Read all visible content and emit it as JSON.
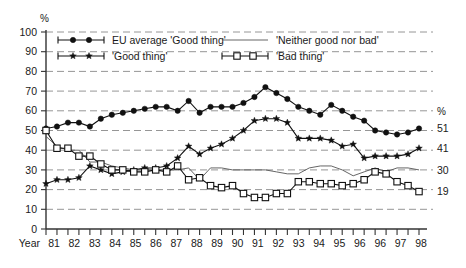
{
  "chart_data": {
    "type": "line",
    "title": "",
    "subtitle": "",
    "xlabel": "Year",
    "ylabel": "%",
    "ylim": [
      0,
      100
    ],
    "xlim": [
      1981,
      1998
    ],
    "grid": true,
    "legend_position": "top",
    "y_ticks": [
      0,
      10,
      20,
      30,
      40,
      50,
      60,
      70,
      80,
      90,
      100
    ],
    "x_tick_labels": [
      "81",
      "82",
      "83",
      "84",
      "85",
      "86",
      "87",
      "88",
      "89",
      "90",
      "91",
      "92",
      "93",
      "94",
      "95",
      "96",
      "96",
      "97",
      "98"
    ],
    "x_values": [
      1981.0,
      1981.5,
      1982.0,
      1982.5,
      1983.0,
      1983.5,
      1984.0,
      1984.5,
      1985.0,
      1985.5,
      1986.0,
      1986.5,
      1987.0,
      1987.5,
      1988.0,
      1988.5,
      1989.0,
      1989.5,
      1990.0,
      1990.5,
      1991.0,
      1991.5,
      1992.0,
      1992.5,
      1993.0,
      1993.5,
      1994.0,
      1994.5,
      1995.0,
      1995.5,
      1996.0,
      1996.5,
      1997.0,
      1997.5,
      1998.0
    ],
    "series": [
      {
        "name": "EU average 'Good thing'",
        "marker": "filled-circle",
        "end_label": "51",
        "values": [
          51,
          52,
          54,
          54,
          52,
          56,
          58,
          59,
          60,
          61,
          62,
          62,
          60,
          65,
          59,
          62,
          62,
          62,
          64,
          67,
          72,
          69,
          66,
          62,
          60,
          58,
          63,
          60,
          57,
          55,
          50,
          49,
          48,
          49,
          51
        ]
      },
      {
        "name": "'Good thing'",
        "marker": "filled-star",
        "end_label": "41",
        "values": [
          23,
          25,
          25,
          26,
          32,
          30,
          28,
          29,
          30,
          31,
          31,
          32,
          36,
          42,
          38,
          41,
          43,
          46,
          50,
          55,
          56,
          56,
          54,
          46,
          46,
          46,
          45,
          42,
          43,
          36,
          37,
          37,
          37,
          38,
          41
        ]
      },
      {
        "name": "'Neither good nor bad'",
        "marker": "none",
        "end_label": "30",
        "values": [
          47,
          42,
          40,
          40,
          34,
          34,
          32,
          31,
          30,
          30,
          30,
          30,
          30,
          31,
          25,
          31,
          31,
          30,
          30,
          30,
          30,
          29,
          28,
          28,
          31,
          32,
          32,
          30,
          27,
          29,
          31,
          29,
          31,
          31,
          30
        ]
      },
      {
        "name": "'Bad thing'",
        "marker": "open-square",
        "end_label": "19",
        "values": [
          50,
          41,
          41,
          37,
          37,
          33,
          30,
          30,
          29,
          29,
          30,
          29,
          32,
          25,
          26,
          22,
          21,
          22,
          18,
          16,
          16,
          18,
          18,
          24,
          24,
          23,
          23,
          22,
          23,
          25,
          29,
          28,
          24,
          22,
          19
        ]
      }
    ],
    "legend": [
      {
        "label": "EU average 'Good thing'",
        "marker": "filled-circle"
      },
      {
        "label": "'Good thing'",
        "marker": "filled-star"
      },
      {
        "label": "'Neither good nor bad'",
        "marker": "line"
      },
      {
        "label": "'Bad thing'",
        "marker": "open-square"
      }
    ],
    "right_axis_unit": "%",
    "colors": {
      "ink": "#111111",
      "grid": "#8a8a8a",
      "axis": "#333333"
    }
  }
}
